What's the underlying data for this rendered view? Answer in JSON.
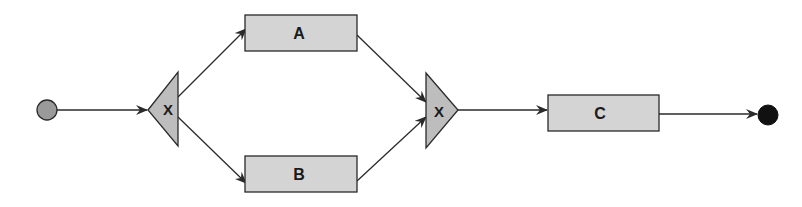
{
  "diagram": {
    "type": "process-flow",
    "colors": {
      "background": "#ffffff",
      "node_fill": "#d4d4d4",
      "gateway_fill": "#bdbdbd",
      "stroke": "#2a2a2a",
      "start_fill": "#9a9a9a",
      "end_fill": "#111111"
    },
    "nodes": [
      {
        "id": "start",
        "kind": "start-event"
      },
      {
        "id": "split",
        "kind": "xor-gateway",
        "label": "X"
      },
      {
        "id": "A",
        "kind": "task",
        "label": "A"
      },
      {
        "id": "B",
        "kind": "task",
        "label": "B"
      },
      {
        "id": "join",
        "kind": "xor-gateway",
        "label": "X"
      },
      {
        "id": "C",
        "kind": "task",
        "label": "C"
      },
      {
        "id": "end",
        "kind": "end-event"
      }
    ],
    "edges": [
      {
        "from": "start",
        "to": "split"
      },
      {
        "from": "split",
        "to": "A"
      },
      {
        "from": "split",
        "to": "B"
      },
      {
        "from": "A",
        "to": "join"
      },
      {
        "from": "B",
        "to": "join"
      },
      {
        "from": "join",
        "to": "C"
      },
      {
        "from": "C",
        "to": "end"
      }
    ]
  }
}
